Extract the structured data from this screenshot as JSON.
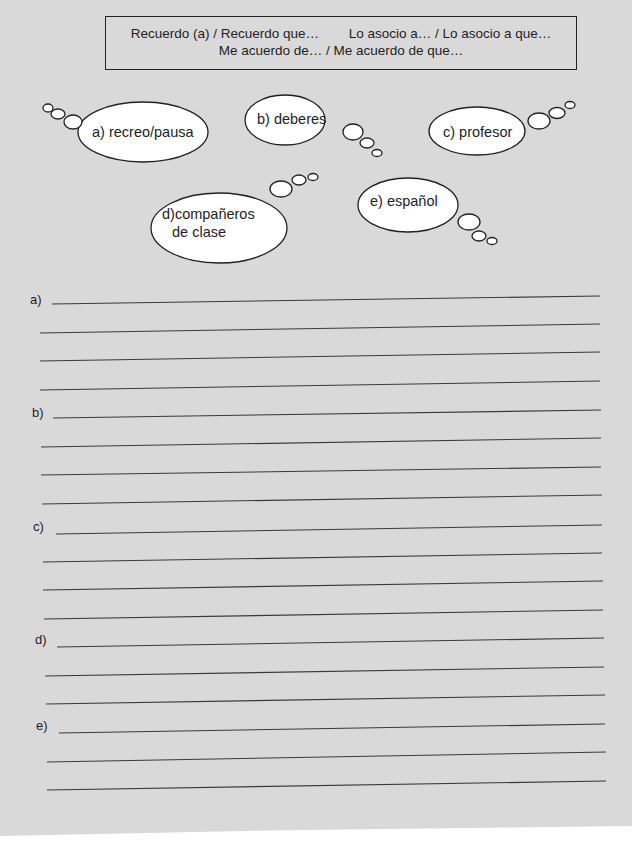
{
  "phrase_box": {
    "line1_part1": "Recuerdo (a) / Recuerdo que…",
    "line1_part2": "Lo asocio a… / Lo asocio a que…",
    "line2": "Me acuerdo de… / Me acuerdo de que…"
  },
  "thought_bubbles": [
    {
      "id": "a",
      "text": "a) recreo/pausa"
    },
    {
      "id": "b",
      "text": "b) deberes"
    },
    {
      "id": "c",
      "text": "c) profesor"
    },
    {
      "id": "d",
      "line1": "d)compañeros",
      "line2": "de clase"
    },
    {
      "id": "e",
      "text": "e) español"
    }
  ],
  "answer_sections": [
    {
      "label": "a)",
      "lines": 4
    },
    {
      "label": "b)",
      "lines": 4
    },
    {
      "label": "c)",
      "lines": 4
    },
    {
      "label": "d)",
      "lines": 3
    },
    {
      "label": "e)",
      "lines": 3
    }
  ]
}
